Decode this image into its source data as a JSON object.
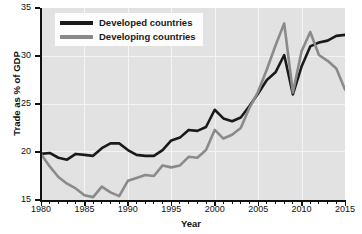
{
  "chart_data": {
    "type": "line",
    "title": "",
    "xlabel": "Year",
    "ylabel": "Trade as % of GDP",
    "xlim": [
      1980,
      2015
    ],
    "ylim": [
      15,
      35
    ],
    "grid": true,
    "legend_position": "top-left",
    "x_ticks": [
      1980,
      1985,
      1990,
      1995,
      2000,
      2005,
      2010,
      2015
    ],
    "x_tick_labels": [
      "1980",
      "1985",
      "1990",
      "1995",
      "2000",
      "2005",
      "2010",
      "2015"
    ],
    "y_ticks": [
      15,
      20,
      25,
      30,
      35
    ],
    "y_tick_labels": [
      "15",
      "20",
      "25",
      "30",
      "35"
    ],
    "x": [
      1980,
      1981,
      1982,
      1983,
      1984,
      1985,
      1986,
      1987,
      1988,
      1989,
      1990,
      1991,
      1992,
      1993,
      1994,
      1995,
      1996,
      1997,
      1998,
      1999,
      2000,
      2001,
      2002,
      2003,
      2004,
      2005,
      2006,
      2007,
      2008,
      2009,
      2010,
      2011,
      2012,
      2013,
      2014,
      2015
    ],
    "series": [
      {
        "name": "Developed countries",
        "color": "#1a1a1a",
        "values": [
          19.8,
          19.9,
          19.4,
          19.2,
          19.8,
          19.7,
          19.6,
          20.4,
          20.9,
          20.9,
          20.2,
          19.7,
          19.6,
          19.6,
          20.2,
          21.2,
          21.5,
          22.3,
          22.2,
          22.6,
          24.4,
          23.5,
          23.2,
          23.6,
          24.8,
          26.1,
          27.5,
          28.3,
          30.1,
          26.0,
          28.9,
          31.0,
          31.4,
          31.6,
          32.1,
          32.2
        ]
      },
      {
        "name": "Developing countries",
        "color": "#8a8a8a",
        "values": [
          19.8,
          18.5,
          17.4,
          16.7,
          16.2,
          15.5,
          15.3,
          16.4,
          15.8,
          15.4,
          17.0,
          17.3,
          17.6,
          17.5,
          18.6,
          18.4,
          18.6,
          19.5,
          19.4,
          20.2,
          22.3,
          21.4,
          21.8,
          22.5,
          24.6,
          26.3,
          28.6,
          31.1,
          33.4,
          26.2,
          30.5,
          32.5,
          30.1,
          29.5,
          28.7,
          26.5
        ]
      }
    ]
  },
  "legend": {
    "items": [
      {
        "label": "Developed countries",
        "color": "#1a1a1a"
      },
      {
        "label": "Developing countries",
        "color": "#8a8a8a"
      }
    ]
  },
  "axes": {
    "x_title": "Year",
    "y_title": "Trade as % of GDP"
  }
}
